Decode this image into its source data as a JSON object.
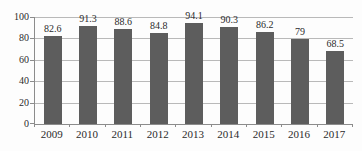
{
  "chart_data": {
    "type": "bar",
    "categories": [
      "2009",
      "2010",
      "2011",
      "2012",
      "2013",
      "2014",
      "2015",
      "2016",
      "2017"
    ],
    "values": [
      82.6,
      91.3,
      88.6,
      84.8,
      94.1,
      90.3,
      86.2,
      79,
      68.5
    ],
    "value_labels": [
      "82.6",
      "91.3",
      "88.6",
      "84.8",
      "94.1",
      "90.3",
      "86.2",
      "79",
      "68.5"
    ],
    "ylim": [
      0,
      100
    ],
    "yticks": [
      0,
      20,
      40,
      60,
      80,
      100
    ],
    "ytick_labels": [
      "0",
      "20",
      "40",
      "60",
      "80",
      "100"
    ],
    "grid": true,
    "legend_position": "none",
    "bar_color": "#5d5d5d",
    "gridline_color": "#b9b9b9",
    "axis_color": "#8c8c8c",
    "label_color": "#2b2b2b",
    "background_color": "#fdfdfd"
  }
}
